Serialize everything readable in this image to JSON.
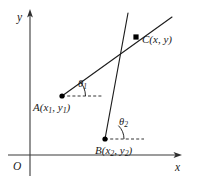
{
  "figure": {
    "type": "coordinate-geometry-diagram",
    "background_color": "#ffffff",
    "line_color": "#1d1d1d",
    "axis_color": "#3a3a3a"
  },
  "axes": {
    "y_label": "y",
    "x_label": "x",
    "origin_label": "O",
    "y_axis": {
      "x": 30,
      "y_top": 12,
      "y_bottom": 176
    },
    "x_axis": {
      "y": 155,
      "x_left": 8,
      "x_right": 181
    }
  },
  "points": [
    {
      "id": "A",
      "label_name": "A",
      "label_open": "(",
      "label_x_var": "x",
      "label_x_sub": "1",
      "label_comma": ", ",
      "label_y_var": "y",
      "label_y_sub": "1",
      "label_close": ")",
      "label_text": "A(x1, y1)",
      "cx": 62,
      "cy": 96
    },
    {
      "id": "B",
      "label_name": "B",
      "label_open": "(",
      "label_x_var": "x",
      "label_x_sub": "2",
      "label_comma": ", ",
      "label_y_var": "y",
      "label_y_sub": "2",
      "label_close": ")",
      "label_text": "B(x2, y2)",
      "cx": 105,
      "cy": 139
    },
    {
      "id": "C",
      "label_name": "C",
      "label_open": "(",
      "label_x_var": "x",
      "label_x_sub": "",
      "label_comma": ", ",
      "label_y_var": "y",
      "label_y_sub": "",
      "label_close": ")",
      "label_text": "C(x, y)",
      "cx": 136,
      "cy": 37
    }
  ],
  "angles": [
    {
      "id": "theta1",
      "symbol": "θ",
      "subscript": "1",
      "at_point": "A",
      "label_left": 78,
      "label_top": 80
    },
    {
      "id": "theta2",
      "symbol": "θ",
      "subscript": "2",
      "at_point": "B",
      "label_left": 119,
      "label_top": 118
    }
  ],
  "rays": [
    {
      "id": "ray-AC",
      "from": "A",
      "through": "C",
      "x1": 62,
      "y1": 96,
      "x2": 172,
      "y2": 17
    },
    {
      "id": "ray-BC",
      "from": "B",
      "through": "C",
      "x1": 105,
      "y1": 139,
      "x2": 128,
      "y2": 13
    }
  ],
  "dashed_guides": [
    {
      "id": "guide-A",
      "x1": 62,
      "y1": 96,
      "x2": 103,
      "y2": 96
    },
    {
      "id": "guide-B",
      "x1": 105,
      "y1": 139,
      "x2": 144,
      "y2": 139
    }
  ]
}
